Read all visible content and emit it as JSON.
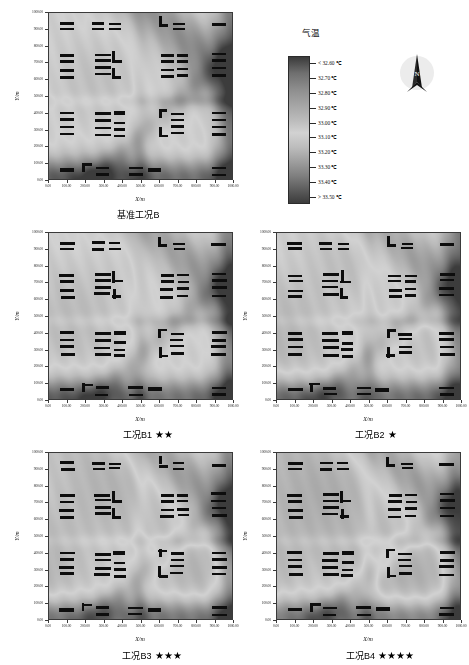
{
  "figure": {
    "axis_labels": {
      "x": "X/m",
      "y": "Y/m"
    },
    "x_ticks": [
      "0.00",
      "100.00",
      "200.00",
      "300.00",
      "400.00",
      "500.00",
      "600.00",
      "700.00",
      "800.00",
      "900.00",
      "1000.00"
    ],
    "y_ticks": [
      "0.00",
      "100.00",
      "200.00",
      "300.00",
      "400.00",
      "500.00",
      "600.00",
      "700.00",
      "800.00",
      "900.00",
      "1000.00"
    ]
  },
  "legend": {
    "title": "气温",
    "labels": [
      "< 32.60 ℃",
      "32.70 ℃",
      "32.80 ℃",
      "32.90 ℃",
      "33.00 ℃",
      "33.10 ℃",
      "33.20 ℃",
      "33.30 ℃",
      "33.40 ℃",
      "> 33.50 ℃"
    ],
    "values": [
      32.6,
      32.7,
      32.8,
      32.9,
      33.0,
      33.1,
      33.2,
      33.3,
      33.4,
      33.5
    ],
    "unit": "℃"
  },
  "compass": {
    "label": "N",
    "name": "north-arrow"
  },
  "panels": [
    {
      "id": "base",
      "caption": "基准工况B",
      "stars": ""
    },
    {
      "id": "b1",
      "caption": "工况B1",
      "stars": "★★"
    },
    {
      "id": "b2",
      "caption": "工况B2",
      "stars": "★"
    },
    {
      "id": "b3",
      "caption": "工况B3",
      "stars": "★★★"
    },
    {
      "id": "b4",
      "caption": "工况B4",
      "stars": "★★★★"
    }
  ],
  "chart_data": {
    "type": "heatmap",
    "title": "",
    "xlabel": "X/m",
    "ylabel": "Y/m",
    "xlim": [
      0,
      1000
    ],
    "ylim": [
      0,
      1000
    ],
    "grid": false,
    "legend_position": "top-right",
    "colorbar": {
      "title": "气温",
      "unit": "℃",
      "ticks": [
        32.6,
        32.7,
        32.8,
        32.9,
        33.0,
        33.1,
        33.2,
        33.3,
        33.4,
        33.5
      ],
      "tick_labels": [
        "< 32.60 ℃",
        "32.70 ℃",
        "32.80 ℃",
        "32.90 ℃",
        "33.00 ℃",
        "33.10 ℃",
        "33.20 ℃",
        "33.30 ℃",
        "33.40 ℃",
        "> 33.50 ℃"
      ],
      "vmin": 32.6,
      "vmax": 33.5
    },
    "panels": [
      {
        "name": "基准工况B",
        "stars": 0,
        "mean_temp": 33.15,
        "hot_zone": "south and east edges",
        "cool_zone": "north-west block interior"
      },
      {
        "name": "工况B1",
        "stars": 2,
        "mean_temp": 33.1,
        "hot_zone": "south edge and north-east corridor",
        "cool_zone": "central block"
      },
      {
        "name": "工况B2",
        "stars": 1,
        "mean_temp": 33.12,
        "hot_zone": "south-east diagonal",
        "cool_zone": "north-west block interior"
      },
      {
        "name": "工况B3",
        "stars": 3,
        "mean_temp": 33.05,
        "hot_zone": "south-west and east margins",
        "cool_zone": "north-central block"
      },
      {
        "name": "工况B4",
        "stars": 4,
        "mean_temp": 33.0,
        "hot_zone": "perimeter streets",
        "cool_zone": "interior courtyards"
      }
    ],
    "buildings_note": "black rectangles are building footprints masked out of the temperature field"
  }
}
